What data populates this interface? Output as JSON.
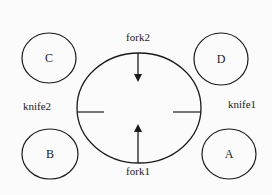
{
  "diagram": {
    "type": "dining-philosophers",
    "stroke_color": "#1a1a1a",
    "background": "#fbfbfb",
    "philosophers": [
      {
        "label": "C",
        "cx": 49,
        "cy": 58,
        "rx": 27,
        "ry": 25
      },
      {
        "label": "D",
        "cx": 221,
        "cy": 59,
        "rx": 27,
        "ry": 26
      },
      {
        "label": "B",
        "cx": 50,
        "cy": 154,
        "rx": 28,
        "ry": 25
      },
      {
        "label": "A",
        "cx": 229,
        "cy": 154,
        "rx": 27,
        "ry": 25
      }
    ],
    "table": {
      "cx": 139,
      "cy": 108,
      "rx": 62,
      "ry": 55
    },
    "utensils": {
      "fork2": {
        "label": "fork2",
        "type": "arrow-down"
      },
      "fork1": {
        "label": "fork1",
        "type": "arrow-up"
      },
      "knife2": {
        "label": "knife2",
        "type": "line-left"
      },
      "knife1": {
        "label": "knife1",
        "type": "line-right"
      }
    }
  }
}
